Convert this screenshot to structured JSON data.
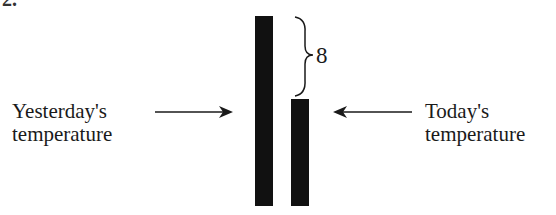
{
  "figure": {
    "cropped_label_fragment": "2.",
    "left_label": {
      "line1": "Yesterday's",
      "line2": "temperature"
    },
    "right_label": {
      "line1": "Today's",
      "line2": "temperature"
    },
    "difference_label": "8",
    "bars": [
      {
        "name": "yesterday",
        "relative_height": 190
      },
      {
        "name": "today",
        "relative_height": 107
      }
    ],
    "bar_color": "#111111"
  }
}
